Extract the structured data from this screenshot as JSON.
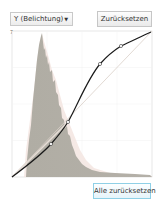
{
  "channel_select": {
    "value": "Y (Belichtung)",
    "arrow": "▼"
  },
  "buttons": {
    "reset_label": "Zurücksetzen",
    "reset_all_label": "Alle zurücksetzen"
  },
  "graph": {
    "corner_label": "7",
    "bounds": {
      "left": 12,
      "top": 31,
      "right": 152,
      "bottom": 177
    },
    "curve_color": "#1a1a1a",
    "histogram_color": "#a8a59c",
    "control_points": [
      [
        12,
        177
      ],
      [
        51,
        144
      ],
      [
        68,
        122
      ],
      [
        100,
        64
      ],
      [
        121,
        46
      ],
      [
        151,
        32
      ]
    ]
  }
}
